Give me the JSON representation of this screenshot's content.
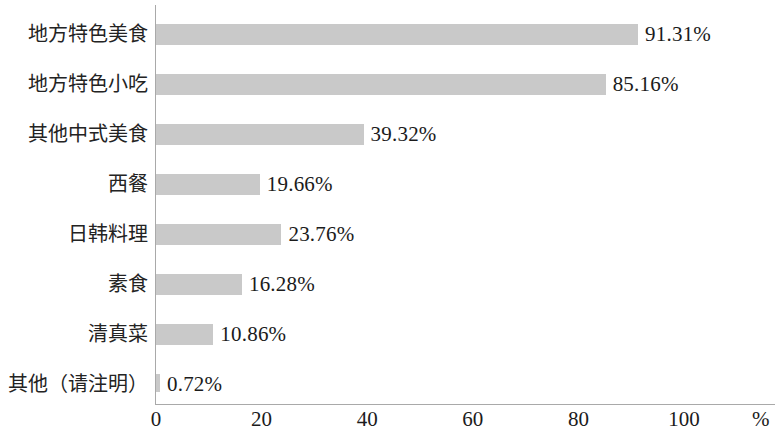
{
  "chart_data": {
    "type": "bar",
    "orientation": "horizontal",
    "title": "",
    "subtitle": "",
    "xlabel": "%",
    "ylabel": "",
    "categories": [
      "地方特色美食",
      "地方特色小吃",
      "其他中式美食",
      "西餐",
      "日韩料理",
      "素食",
      "清真菜",
      "其他（请注明）"
    ],
    "values": [
      91.31,
      85.16,
      39.32,
      19.66,
      23.76,
      16.28,
      10.86,
      0.72
    ],
    "value_labels": [
      "91.31%",
      "85.16%",
      "39.32%",
      "19.66%",
      "23.76%",
      "16.28%",
      "10.86%",
      "0.72%"
    ],
    "xlim": [
      0,
      100
    ],
    "xticks": [
      0,
      20,
      40,
      60,
      80,
      100
    ],
    "xtick_labels": [
      "0",
      "20",
      "40",
      "60",
      "80",
      "100"
    ],
    "unit_label": "%",
    "grid": false,
    "legend": false,
    "bar_color": "#c9c9c9",
    "axis_color": "#a9a9a9",
    "text_color": "#1b1b1b"
  }
}
